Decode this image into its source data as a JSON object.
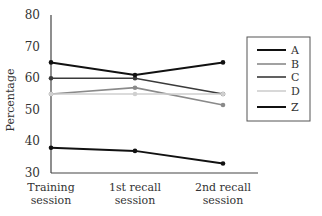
{
  "chart_data": {
    "type": "line",
    "title": "",
    "xlabel": "",
    "ylabel": "Percentage",
    "ylim": [
      30,
      80
    ],
    "yticks": [
      30,
      40,
      50,
      60,
      70,
      80
    ],
    "categories": [
      [
        "Training",
        "session"
      ],
      [
        "1st recall",
        "session"
      ],
      [
        "2nd recall",
        "session"
      ]
    ],
    "grid": false,
    "legend_position": "right (boxed)",
    "series": [
      {
        "name": "A",
        "color": "#111111",
        "width": 2,
        "values": [
          38,
          37,
          33
        ]
      },
      {
        "name": "B",
        "color": "#8a8a8a",
        "width": 1.6,
        "values": [
          55,
          57,
          51.5
        ]
      },
      {
        "name": "C",
        "color": "#3a3a3a",
        "width": 1.6,
        "values": [
          60,
          60,
          55
        ]
      },
      {
        "name": "D",
        "color": "#cfcfcf",
        "width": 1.6,
        "values": [
          55,
          55,
          55
        ]
      },
      {
        "name": "Z",
        "color": "#111111",
        "width": 2,
        "values": [
          65,
          61,
          65
        ]
      }
    ]
  }
}
